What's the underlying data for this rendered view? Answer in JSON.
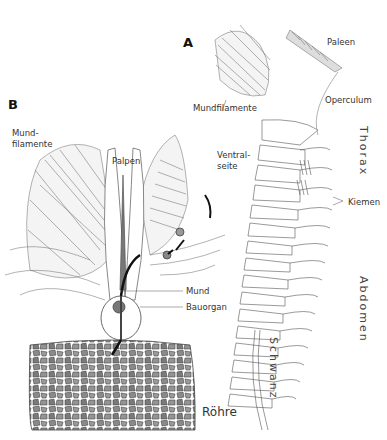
{
  "figure": {
    "panels": [
      {
        "id": "A",
        "label": "A"
      },
      {
        "id": "B",
        "label": "B"
      }
    ],
    "panel_a": {
      "labels": {
        "paleen": "Paleen",
        "operculum": "Operculum",
        "mundfilamente": "Mundfilamente",
        "ventralseite_line1": "Ventral-",
        "ventralseite_line2": "seite",
        "kiemen": "Kiemen",
        "thorax": "Thorax",
        "abdomen": "Abdomen",
        "schwanz": "Schwanz"
      }
    },
    "panel_b": {
      "labels": {
        "mundfilamente_line1": "Mund-",
        "mundfilamente_line2": "filamente",
        "palpen": "Palpen",
        "mund": "Mund",
        "bauorgan": "Bauorgan",
        "roehre": "Röhre"
      }
    },
    "colors": {
      "line": "#555555",
      "text": "#333333",
      "tube_fill": "#8a8a8a"
    }
  }
}
